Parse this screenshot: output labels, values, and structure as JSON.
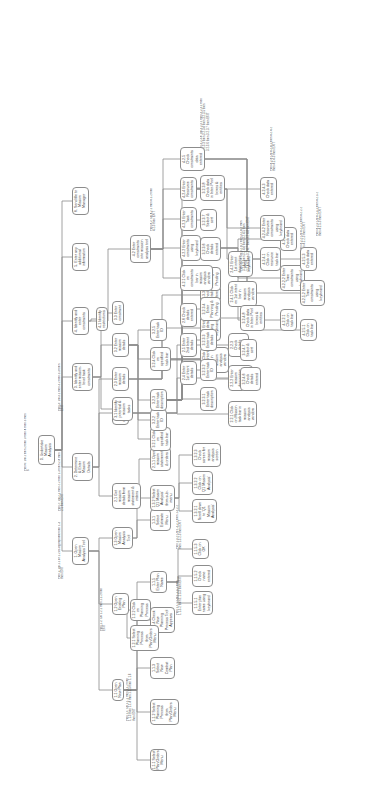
{
  "diagram": {
    "type": "hierarchical-task-analysis",
    "orientation": "rotated-90-ccw",
    "colors": {
      "background": "#ffffff",
      "node_border": "#8c8c8c",
      "line": "#8a8a8a",
      "text": "#3a3a3a"
    }
  },
  "nodes": [
    {
      "id": "0",
      "label": "0. Undertake Mission Analysis",
      "x": 346,
      "y": 38,
      "w": 30,
      "h": 14
    },
    {
      "id": "p0",
      "plan": "Plan 0: Do 1 then 2 then 3 then 4 then 5 then 6",
      "x": 340,
      "y": 24,
      "w": 60,
      "h": 8
    },
    {
      "id": "1",
      "label": "1. Open Mission Analysis Tool",
      "x": 246,
      "y": 72,
      "w": 28,
      "h": 14
    },
    {
      "id": "p1",
      "plan": "Plan 1: Do 1.1 or 1.2 as appropriate then 1.3 then EXIT",
      "x": 232,
      "y": 58,
      "w": 60,
      "h": 10
    },
    {
      "id": "2",
      "label": "2. Determine & Enter Mission Details",
      "x": 330,
      "y": 72,
      "w": 28,
      "h": 14
    },
    {
      "id": "p2",
      "plan": "Plan 2: Do 2.1 then 2.2 then 2.3 then 2.4 then 2.5 then EXIT",
      "x": 300,
      "y": 58,
      "w": 62,
      "h": 10
    },
    {
      "id": "3",
      "label": "3. Identify and enter mission-level task constraints",
      "x": 420,
      "y": 72,
      "w": 28,
      "h": 18
    },
    {
      "id": "p3",
      "plan": "Plan 3: Do 3.1 then 3.2 then 3.3 then EXIT",
      "x": 400,
      "y": 58,
      "w": 50,
      "h": 8
    },
    {
      "id": "4",
      "label": "4. Identify and enter constraints",
      "x": 476,
      "y": 72,
      "w": 28,
      "h": 14
    },
    {
      "id": "5",
      "label": "5. Enter any additional information",
      "x": 540,
      "y": 72,
      "w": 28,
      "h": 14
    },
    {
      "id": "6",
      "label": "6. Send file to Mission Manager",
      "x": 596,
      "y": 72,
      "w": 28,
      "h": 14
    },
    {
      "id": "1.1",
      "label": "1.1 Open New Plan",
      "x": 110,
      "y": 112,
      "w": 22,
      "h": 12
    },
    {
      "id": "p1.1",
      "plan": "Plan 1.1: Do 1.1.1 then 1.1.2 then 1.1.3 then 1.1.4 then 1.1.5 then 1.1.6 then EXIT",
      "x": 90,
      "y": 126,
      "w": 48,
      "h": 14
    },
    {
      "id": "1.2",
      "label": "1.2 Open Existing Plan",
      "x": 196,
      "y": 112,
      "w": 22,
      "h": 12
    },
    {
      "id": "p1.2",
      "plan": "Plan 1.2: Do 1.2.1 then 1.2.2 then EXIT",
      "x": 180,
      "y": 100,
      "w": 44,
      "h": 8
    },
    {
      "id": "1.3",
      "label": "1.3 Open Mission Analysis Tool",
      "x": 262,
      "y": 112,
      "w": 22,
      "h": 12
    },
    {
      "id": "2.1",
      "label": "2.1 Get mission details from mission statement & orders",
      "x": 302,
      "y": 112,
      "w": 26,
      "h": 16
    },
    {
      "id": "2.2",
      "label": "2.2 Enter Mission description",
      "x": 386,
      "y": 112,
      "w": 24,
      "h": 14
    },
    {
      "id": "2.3",
      "label": "2.3 Enter mission details",
      "x": 420,
      "y": 112,
      "w": 24,
      "h": 12
    },
    {
      "id": "3.1",
      "label": "3.1 Identify potential & mission tasks",
      "x": 390,
      "y": 112,
      "w": 24,
      "h": 14
    },
    {
      "id": "3.2",
      "label": "3.2 Enter mission details",
      "x": 454,
      "y": 112,
      "w": 24,
      "h": 14
    },
    {
      "id": "3.3",
      "label": "3.3 Enter constraint",
      "x": 486,
      "y": 112,
      "w": 24,
      "h": 12
    },
    {
      "id": "4.1",
      "label": "4.1 Identify restrictions",
      "x": 480,
      "y": 96,
      "w": 24,
      "h": 12
    },
    {
      "id": "4.2",
      "label": "4.2 Enter constraints into mission analysis tool",
      "x": 548,
      "y": 130,
      "w": 28,
      "h": 16
    },
    {
      "id": "p4.2",
      "plan": "Plan 4.2: Do 4.2.1 then 4.2.2 then 4.2.3 then EXIT",
      "x": 580,
      "y": 150,
      "w": 50,
      "h": 14
    },
    {
      "id": "1.1.1",
      "label": "1.1.1 Select Plan/Orders Menu",
      "x": 40,
      "y": 150,
      "w": 22,
      "h": 14
    },
    {
      "id": "1.1.2",
      "label": "1.1.2 Select Planning Process from Plan/Orders Menu",
      "x": 86,
      "y": 150,
      "w": 26,
      "h": 16
    },
    {
      "id": "1.1.3",
      "label": "1.1.3 Select New Combat Plan",
      "x": 132,
      "y": 150,
      "w": 22,
      "h": 14
    },
    {
      "id": "1.1.4",
      "label": "1.1.4 Check New Planning Process Tool Appears",
      "x": 178,
      "y": 150,
      "w": 26,
      "h": 16
    },
    {
      "id": "1.1.5",
      "label": "1.1.5 Enter Plan Name",
      "x": 218,
      "y": 150,
      "w": 22,
      "h": 14
    },
    {
      "id": "p1.1.5",
      "plan": "Plan 1.1.5: Do 1.1.5.1 then 1.1.5.2 then 1.1.5.3 then EXIT",
      "x": 196,
      "y": 176,
      "w": 44,
      "h": 12
    },
    {
      "id": "1.2.1",
      "label": "1.2.1 Select Planning Process from Plan/Orders Menu",
      "x": 160,
      "y": 130,
      "w": 26,
      "h": 16
    },
    {
      "id": "1.2.2",
      "label": "1.2.2 Click on Planning Process",
      "x": 190,
      "y": 130,
      "w": 22,
      "h": 14
    },
    {
      "id": "1.3.1",
      "label": "1.3.1 Select Estimate Menu",
      "x": 280,
      "y": 150,
      "w": 22,
      "h": 14
    },
    {
      "id": "1.3.2",
      "label": "1.3.2 Select 'Q1 Mission Analysis' from sub-menu",
      "x": 300,
      "y": 150,
      "w": 26,
      "h": 16
    },
    {
      "id": "p1.3.2",
      "plan": "Plan 1.3.2: Do 1.3.2.1 then 1.3.2.2 then 1.3.2.3 then EXIT",
      "x": 262,
      "y": 176,
      "w": 50,
      "h": 12
    },
    {
      "id": "1.1.5.1",
      "label": "1.1.5.1 Enter plan name using keyboard",
      "x": 196,
      "y": 192,
      "w": 24,
      "h": 14
    },
    {
      "id": "1.1.5.2",
      "label": "1.1.5.2 Check name entered",
      "x": 224,
      "y": 192,
      "w": 22,
      "h": 14
    },
    {
      "id": "1.1.5.3",
      "label": "1.1.5.3 Click on OK",
      "x": 252,
      "y": 192,
      "w": 20,
      "h": 12
    },
    {
      "id": "1.3.2.1",
      "label": "1.3.2.1 Scroll down to 'Q1 Mission Analysis'",
      "x": 288,
      "y": 192,
      "w": 24,
      "h": 16
    },
    {
      "id": "1.3.2.2",
      "label": "1.3.2.2 Click on 'Q1 Mission Analysis'",
      "x": 316,
      "y": 192,
      "w": 24,
      "h": 16
    },
    {
      "id": "1.3.2.3",
      "label": "1.3.2.3 Check screen for mission analysis screen",
      "x": 344,
      "y": 192,
      "w": 24,
      "h": 16
    },
    {
      "id": "2.1.1",
      "label": "2.1.1 Open mission statement & orders",
      "x": 340,
      "y": 150,
      "w": 24,
      "h": 14
    },
    {
      "id": "2.2.1",
      "label": "2.2.1 Click on Mission task bar in mission analysis window",
      "x": 384,
      "y": 228,
      "w": 26,
      "h": 18
    },
    {
      "id": "2.2.2",
      "label": "2.2.2 Enter mission description using keyboard",
      "x": 420,
      "y": 228,
      "w": 26,
      "h": 18
    },
    {
      "id": "2.2.3",
      "label": "2.2.3 Check details entered",
      "x": 454,
      "y": 228,
      "w": 24,
      "h": 14
    },
    {
      "id": "2.3.1",
      "label": "2.3.1 Click on 'Q' Intent bar in mission analysis window",
      "x": 438,
      "y": 200,
      "w": 26,
      "h": 18
    },
    {
      "id": "2.3.2",
      "label": "2.3.2 Enter intent details using keyboard",
      "x": 470,
      "y": 200,
      "w": 26,
      "h": 18
    },
    {
      "id": "2.3.3",
      "label": "2.3.3 Check details entered",
      "x": 504,
      "y": 200,
      "w": 24,
      "h": 14
    },
    {
      "id": "2.4",
      "label": "2.4 Enter 1st Intent details",
      "x": 426,
      "y": 180,
      "w": 24,
      "h": 14
    },
    {
      "id": "2.5",
      "label": "2.5 Enter 2nd Intent details",
      "x": 454,
      "y": 180,
      "w": 24,
      "h": 14
    },
    {
      "id": "2.6",
      "label": "2.6 Check details entered",
      "x": 484,
      "y": 180,
      "w": 24,
      "h": 12
    },
    {
      "id": "2.4.1",
      "label": "2.4.1 Click on 1st intent bar in mission analysis window",
      "x": 504,
      "y": 228,
      "w": 26,
      "h": 18
    },
    {
      "id": "2.4.2",
      "label": "2.4.2 Enter 1st intent description using keyboard",
      "x": 534,
      "y": 228,
      "w": 26,
      "h": 18
    },
    {
      "id": "3.2.1",
      "label": "3.2.1 Click on specified task bar",
      "x": 360,
      "y": 150,
      "w": 24,
      "h": 14
    },
    {
      "id": "3.2.2",
      "label": "3.2.2 Enter task ID",
      "x": 380,
      "y": 150,
      "w": 22,
      "h": 12
    },
    {
      "id": "3.2.3",
      "label": "3.2.3 Enter task description",
      "x": 400,
      "y": 150,
      "w": 22,
      "h": 14
    },
    {
      "id": "3.2.4",
      "label": "3.2.4 Click on specified task bar",
      "x": 440,
      "y": 150,
      "w": 24,
      "h": 14
    },
    {
      "id": "3.2.5",
      "label": "3.2.5 Enter task ID",
      "x": 470,
      "y": 150,
      "w": 22,
      "h": 12
    },
    {
      "id": "3.2.3.1",
      "label": "3.2.3.1 Enter task description",
      "x": 400,
      "y": 200,
      "w": 24,
      "h": 14
    },
    {
      "id": "3.2.3.2",
      "label": "3.2.3.2 Enter task ID",
      "x": 430,
      "y": 200,
      "w": 22,
      "h": 12
    },
    {
      "id": "3.2.3.3",
      "label": "3.2.3.3 Enter task details",
      "x": 460,
      "y": 200,
      "w": 22,
      "h": 14
    },
    {
      "id": "3.2.3.4",
      "label": "3.2.3.4 Enter Planning & Pending",
      "x": 490,
      "y": 200,
      "w": 24,
      "h": 14
    },
    {
      "id": "3.2.3.5",
      "label": "3.2.3.5 Select Planning or Pending",
      "x": 520,
      "y": 200,
      "w": 24,
      "h": 14
    },
    {
      "id": "3.2.3.6",
      "label": "3.2.3.6 Check details entered",
      "x": 550,
      "y": 200,
      "w": 24,
      "h": 14
    },
    {
      "id": "3.2.3.7",
      "label": "3.2.3.7 Select & sort",
      "x": 580,
      "y": 200,
      "w": 22,
      "h": 12
    },
    {
      "id": "3.2.3.8",
      "label": "3.2.3.8 Check data in Inter-Pool boxes & entities",
      "x": 610,
      "y": 200,
      "w": 26,
      "h": 18
    },
    {
      "id": "p3.2.3.8",
      "plan": "Plan 3.2.3.8: Do 3.2.3.1 then 3.2.3.2 then 3.2.3.3 then 3.2.3.4 then 3.2.3.5 then 3.2.3.6 then 3.2.3.7 then EXIT",
      "x": 660,
      "y": 200,
      "w": 56,
      "h": 18
    },
    {
      "id": "3.2.4.6",
      "label": "3.2.4.6 Check details entered",
      "x": 420,
      "y": 240,
      "w": 24,
      "h": 14
    },
    {
      "id": "3.2.4.7",
      "label": "3.2.4.7 Select & sort",
      "x": 450,
      "y": 240,
      "w": 22,
      "h": 12
    },
    {
      "id": "3.2.4.8",
      "label": "3.2.4.8 Check data in Inter-Pool boxes & entities",
      "x": 480,
      "y": 240,
      "w": 26,
      "h": 18
    },
    {
      "id": "p3.2.4.8",
      "plan": "Plan 3.2.4: Do 3.2.4.1 then 3.2.4.2 then 3.2.4.3 then 3.2.4.4 then 3.2.4.5 then 3.2.4.6 then 3.2.4.7 then 3.2.4.8 then EXIT",
      "x": 540,
      "y": 240,
      "w": 56,
      "h": 18
    },
    {
      "id": "4.2.1",
      "label": "4.2.1 Click on constraints bar in mission analysis window",
      "x": 520,
      "y": 180,
      "w": 26,
      "h": 18
    },
    {
      "id": "4.2.2",
      "label": "4.2.2 Enter constraints using keyboard",
      "x": 550,
      "y": 180,
      "w": 26,
      "h": 16
    },
    {
      "id": "4.2.3",
      "label": "4.2.3 Enter Task constraints",
      "x": 580,
      "y": 180,
      "w": 24,
      "h": 14
    },
    {
      "id": "4.2.4",
      "label": "4.2.4 Enter Resource constraints",
      "x": 610,
      "y": 180,
      "w": 24,
      "h": 14
    },
    {
      "id": "4.2.5",
      "label": "4.2.5 Check constraints data entered",
      "x": 640,
      "y": 180,
      "w": 24,
      "h": 14
    },
    {
      "id": "4.2.2.1",
      "label": "4.2.2.1 Click on task bar",
      "x": 480,
      "y": 280,
      "w": 22,
      "h": 14
    },
    {
      "id": "4.2.2.2",
      "label": "4.2.2.2 Enter Time constraints using keyboard",
      "x": 520,
      "y": 280,
      "w": 26,
      "h": 18
    },
    {
      "id": "4.2.2.3",
      "label": "4.2.2.3 Check data entered",
      "x": 560,
      "y": 280,
      "w": 24,
      "h": 14
    },
    {
      "id": "p4.2.2",
      "plan": "Plan 4.2.2: Do 4.2.2.1 then 4.2.2.2 then 4.2.2.3 then EXIT",
      "x": 560,
      "y": 300,
      "w": 48,
      "h": 14
    },
    {
      "id": "4.2.4.1",
      "label": "4.2.4.1 Click on resource task bar",
      "x": 540,
      "y": 260,
      "w": 24,
      "h": 14
    },
    {
      "id": "4.2.4.2",
      "label": "4.2.4.2 Enter Resource constraints using keyboard",
      "x": 570,
      "y": 260,
      "w": 26,
      "h": 18
    },
    {
      "id": "4.2.4.3",
      "label": "4.2.4.3 Check data entered",
      "x": 610,
      "y": 260,
      "w": 24,
      "h": 14
    },
    {
      "id": "p4.2.4",
      "plan": "Plan 4.2.4: Do 4.2.4.1 then 4.2.4.2 then 4.2.4.3 then EXIT",
      "x": 640,
      "y": 270,
      "w": 48,
      "h": 14
    },
    {
      "id": "4.2.5.1",
      "label": "4.2.5.1 Click on task bar",
      "x": 470,
      "y": 300,
      "w": 22,
      "h": 14
    },
    {
      "id": "4.2.5.2",
      "label": "4.2.5.2 Enter Time constraints using keyboard",
      "x": 505,
      "y": 300,
      "w": 26,
      "h": 18
    },
    {
      "id": "4.2.5.3",
      "label": "4.2.5.3 Check data entered",
      "x": 540,
      "y": 300,
      "w": 24,
      "h": 14
    },
    {
      "id": "p4.2.5",
      "plan": "Plan 4.2.5: Do 4.2.5.1 then 4.2.5.2 then 4.2.5.3 then EXIT",
      "x": 575,
      "y": 316,
      "w": 48,
      "h": 14
    }
  ],
  "edges": [
    [
      "0",
      "1"
    ],
    [
      "0",
      "2"
    ],
    [
      "0",
      "3"
    ],
    [
      "0",
      "4"
    ],
    [
      "0",
      "5"
    ],
    [
      "0",
      "6"
    ],
    [
      "1",
      "1.1"
    ],
    [
      "1",
      "1.2"
    ],
    [
      "1",
      "1.3"
    ],
    [
      "2",
      "2.1"
    ],
    [
      "2",
      "2.2"
    ],
    [
      "2",
      "2.3"
    ],
    [
      "3",
      "3.1"
    ],
    [
      "3",
      "3.2"
    ],
    [
      "3",
      "3.3"
    ],
    [
      "4",
      "4.1"
    ],
    [
      "4",
      "4.2"
    ],
    [
      "1.1",
      "1.1.1"
    ],
    [
      "1.1",
      "1.1.2"
    ],
    [
      "1.1",
      "1.1.3"
    ],
    [
      "1.1",
      "1.1.4"
    ],
    [
      "1.1",
      "1.1.5"
    ],
    [
      "1.2",
      "1.2.1"
    ],
    [
      "1.2",
      "1.2.2"
    ],
    [
      "1.3",
      "1.3.1"
    ],
    [
      "1.3",
      "1.3.2"
    ],
    [
      "1.1.5",
      "1.1.5.1"
    ],
    [
      "1.1.5",
      "1.1.5.2"
    ],
    [
      "1.1.5",
      "1.1.5.3"
    ],
    [
      "1.3.2",
      "1.3.2.1"
    ],
    [
      "1.3.2",
      "1.3.2.2"
    ],
    [
      "1.3.2",
      "1.3.2.3"
    ],
    [
      "2.1",
      "2.1.1"
    ],
    [
      "2.2",
      "2.2.1"
    ],
    [
      "2.2",
      "2.2.2"
    ],
    [
      "2.2",
      "2.2.3"
    ],
    [
      "2.3",
      "2.3.1"
    ],
    [
      "2.3",
      "2.3.2"
    ],
    [
      "2.3",
      "2.3.3"
    ],
    [
      "3.2",
      "3.2.1"
    ],
    [
      "3.2",
      "3.2.2"
    ],
    [
      "3.2",
      "3.2.3"
    ],
    [
      "3.2",
      "3.2.4"
    ],
    [
      "3.2",
      "3.2.5"
    ],
    [
      "3.2.3",
      "3.2.3.1"
    ],
    [
      "3.2.3",
      "3.2.3.2"
    ],
    [
      "3.2.3",
      "3.2.3.3"
    ],
    [
      "3.2.3",
      "3.2.3.4"
    ],
    [
      "3.2.3",
      "3.2.3.5"
    ],
    [
      "3.2.3",
      "3.2.3.6"
    ],
    [
      "3.2.3",
      "3.2.3.7"
    ],
    [
      "3.2.3",
      "3.2.3.8"
    ],
    [
      "3.2.4",
      "3.2.4.6"
    ],
    [
      "3.2.4",
      "3.2.4.7"
    ],
    [
      "3.2.4",
      "3.2.4.8"
    ],
    [
      "4.2",
      "4.2.1"
    ],
    [
      "4.2",
      "4.2.2"
    ],
    [
      "4.2",
      "4.2.3"
    ],
    [
      "4.2",
      "4.2.4"
    ],
    [
      "4.2",
      "4.2.5"
    ],
    [
      "4.2.2",
      "4.2.2.1"
    ],
    [
      "4.2.2",
      "4.2.2.2"
    ],
    [
      "4.2.2",
      "4.2.2.3"
    ],
    [
      "4.2.4",
      "4.2.4.1"
    ],
    [
      "4.2.4",
      "4.2.4.2"
    ],
    [
      "4.2.4",
      "4.2.4.3"
    ],
    [
      "4.2.5",
      "4.2.5.1"
    ],
    [
      "4.2.5",
      "4.2.5.2"
    ],
    [
      "4.2.5",
      "4.2.5.3"
    ]
  ]
}
